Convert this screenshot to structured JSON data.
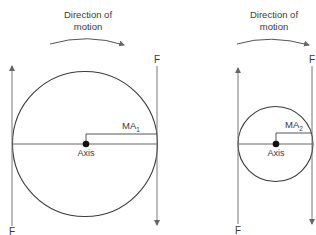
{
  "diagram": {
    "left": {
      "direction_label_line1": "Direction of",
      "direction_label_line2": "motion",
      "force_top_label": "F",
      "force_bottom_label": "F",
      "axis_label": "Axis",
      "moment_arm_label": "MA",
      "moment_arm_subscript": "1"
    },
    "right": {
      "direction_label_line1": "Direction of",
      "direction_label_line2": "motion",
      "force_top_label": "F",
      "force_bottom_label": "F",
      "axis_label": "Axis",
      "moment_arm_label": "MA",
      "moment_arm_subscript": "2"
    },
    "colors": {
      "stroke": "#3a3a3a",
      "force_line": "#707070",
      "curve_arrow": "#555555"
    }
  }
}
